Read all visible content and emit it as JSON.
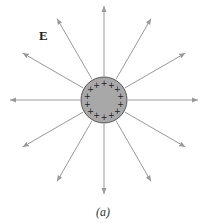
{
  "figure": {
    "field_label": "E",
    "caption": "(a)",
    "sphere": {
      "cx": 104,
      "cy": 100,
      "r": 23,
      "fill": "#a8a8a8",
      "stroke": "#555555",
      "charge_symbol": "+",
      "charge_count": 14
    },
    "field_lines": {
      "count": 12,
      "angle_step_deg": 30,
      "inner_radius": 24,
      "outer_radius": 94,
      "color": "#9a9a9a"
    }
  }
}
